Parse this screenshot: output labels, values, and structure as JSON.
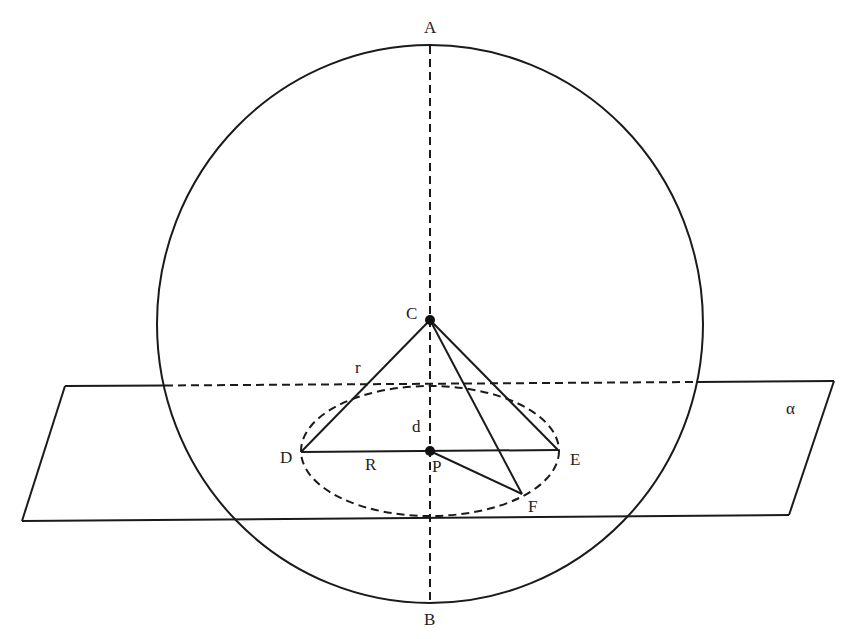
{
  "diagram": {
    "colors": {
      "line": "#1a1a1a",
      "text": "#222222",
      "background": "#ffffff"
    },
    "sphere": {
      "cx": 430,
      "cy": 324,
      "rx": 273,
      "ry": 279
    },
    "axis": {
      "x": 430,
      "y1": 46,
      "y2": 603,
      "style": "dashed"
    },
    "plane": {
      "name": "alpha",
      "label": "α",
      "corners": [
        [
          65,
          386
        ],
        [
          834,
          381
        ],
        [
          789,
          515
        ],
        [
          22,
          521
        ]
      ],
      "hidden_segment": {
        "x1": 165,
        "x2": 697
      }
    },
    "section_circle": {
      "cx": 430,
      "cy": 451,
      "rx": 129,
      "ry": 65,
      "style": "dashed"
    },
    "points": {
      "A": {
        "label": "A",
        "x": 430,
        "y": 46
      },
      "B": {
        "label": "B",
        "x": 430,
        "y": 603
      },
      "C": {
        "label": "C",
        "x": 430,
        "y": 320
      },
      "P": {
        "label": "P",
        "x": 430,
        "y": 451
      },
      "D": {
        "label": "D",
        "x": 301,
        "y": 452
      },
      "E": {
        "label": "E",
        "x": 558,
        "y": 450
      },
      "F": {
        "label": "F",
        "x": 522,
        "y": 494
      }
    },
    "segments": [
      "CD",
      "CE",
      "CF",
      "DE",
      "PF"
    ],
    "segment_labels": {
      "r": "r",
      "d": "d",
      "R": "R"
    }
  }
}
